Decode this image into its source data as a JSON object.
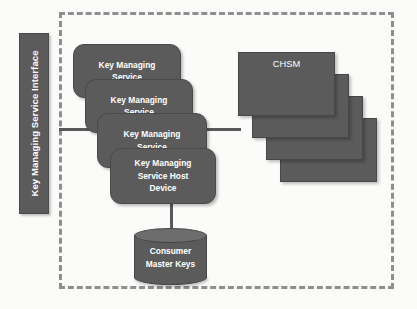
{
  "diagram": {
    "background_color": "#fbfbfa",
    "box_fill_color": "#5b5b5b",
    "box_text_color": "#ffffff",
    "boundary_color": "#8e8e8e",
    "connector_color": "#595959"
  },
  "interface_bar": {
    "label": "Key Managing Service Interface",
    "orientation": "vertical-bottom-to-top"
  },
  "boundary": {
    "style": "dashed",
    "label": ""
  },
  "service_boxes": [
    {
      "label": "Key Managing\nService"
    },
    {
      "label": "Key Managing\nService"
    },
    {
      "label": "Key Managing\nService"
    },
    {
      "label": "Key Managing\nService Host\nDevice"
    }
  ],
  "module_boxes": [
    {
      "label": "CHSM"
    },
    {
      "label": "CHSA"
    },
    {
      "label": "CHSA"
    },
    {
      "label": "CHSA"
    }
  ],
  "datastore": {
    "label": "Consumer\nMaster Keys",
    "shape": "cylinder"
  },
  "connectors": [
    {
      "name": "interface-to-service",
      "orientation": "horizontal"
    },
    {
      "name": "service-to-modules",
      "orientation": "horizontal"
    },
    {
      "name": "host-device-to-datastore",
      "orientation": "vertical"
    }
  ]
}
